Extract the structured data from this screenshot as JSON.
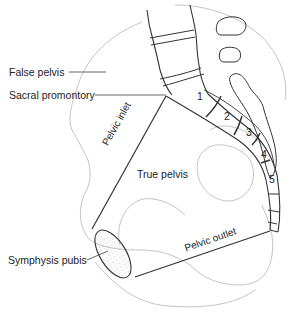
{
  "diagram": {
    "labels": {
      "false_pelvis": "False pelvis",
      "sacral_promontory": "Sacral promontory",
      "pelvic_inlet": "Pelvic inlet",
      "true_pelvis": "True pelvis",
      "symphysis_pubis": "Symphysis pubis",
      "pelvic_outlet": "Pelvic outlet"
    },
    "sacral_segments": [
      "1",
      "2",
      "3",
      "4",
      "5"
    ],
    "colors": {
      "outline_dark": "#333333",
      "outline_light": "#b8b8b8",
      "text": "#222222"
    }
  }
}
